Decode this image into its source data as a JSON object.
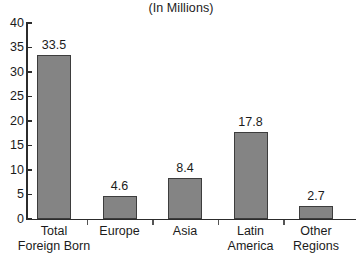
{
  "chart_data": {
    "type": "bar",
    "title": "(In Millions)",
    "subtitle": "",
    "xlabel": "",
    "ylabel": "",
    "ylim": [
      0,
      40
    ],
    "ytick_step": 5,
    "grid": false,
    "legend": "none",
    "bar_color": "#848484",
    "bar_border_color": "#3d3d3d",
    "axis_color": "#2c2c2c",
    "text_color": "#1b1b1b",
    "background": "#ffffff",
    "categories": [
      "Total Foreign Born",
      "Europe",
      "Asia",
      "Latin America",
      "Other Regions"
    ],
    "category_lines": [
      [
        "Total",
        "Foreign Born"
      ],
      [
        "Europe",
        ""
      ],
      [
        "Asia",
        ""
      ],
      [
        "Latin",
        "America"
      ],
      [
        "Other",
        "Regions"
      ]
    ],
    "values": [
      33.5,
      4.6,
      8.4,
      17.8,
      2.7
    ],
    "value_labels": [
      "33.5",
      "4.6",
      "8.4",
      "17.8",
      "2.7"
    ],
    "ytick_labels": [
      "40",
      "35",
      "30",
      "25",
      "20",
      "15",
      "10",
      "5",
      "0"
    ],
    "ytick_values": [
      40,
      35,
      30,
      25,
      20,
      15,
      10,
      5,
      0
    ]
  }
}
